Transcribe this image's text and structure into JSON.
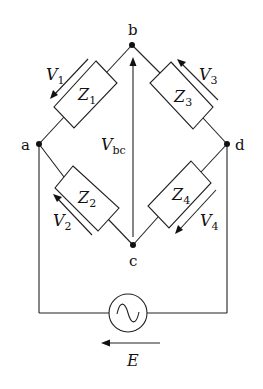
{
  "diagram": {
    "type": "AC bridge circuit",
    "nodes": {
      "a": {
        "label": "a"
      },
      "b": {
        "label": "b"
      },
      "c": {
        "label": "c"
      },
      "d": {
        "label": "d"
      }
    },
    "impedances": [
      {
        "id": "Z1",
        "symbol": "Z",
        "sub": "1",
        "between": "a-b"
      },
      {
        "id": "Z2",
        "symbol": "Z",
        "sub": "2",
        "between": "a-c"
      },
      {
        "id": "Z3",
        "symbol": "Z",
        "sub": "3",
        "between": "b-d"
      },
      {
        "id": "Z4",
        "symbol": "Z",
        "sub": "4",
        "between": "c-d"
      }
    ],
    "voltages": [
      {
        "id": "V1",
        "symbol": "V",
        "sub": "1"
      },
      {
        "id": "V2",
        "symbol": "V",
        "sub": "2"
      },
      {
        "id": "V3",
        "symbol": "V",
        "sub": "3"
      },
      {
        "id": "V4",
        "symbol": "V",
        "sub": "4"
      },
      {
        "id": "Vbc",
        "symbol": "V",
        "sub": "bc"
      }
    ],
    "source": {
      "symbol": "E",
      "type": "AC source",
      "glyph": "~"
    },
    "colors": {
      "line": "#222222",
      "background": "#ffffff"
    }
  }
}
